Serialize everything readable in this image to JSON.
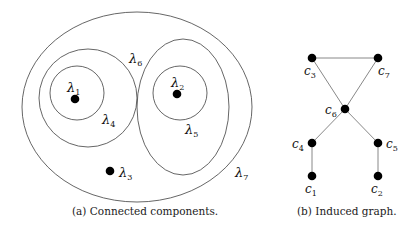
{
  "figure_a": {
    "caption": "(a) Connected components.",
    "regions": [
      {
        "id": "lambda7",
        "label": "λ",
        "sub": "7"
      },
      {
        "id": "lambda6",
        "label": "λ",
        "sub": "6"
      },
      {
        "id": "lambda4",
        "label": "λ",
        "sub": "4"
      },
      {
        "id": "lambda1",
        "label": "λ",
        "sub": "1"
      },
      {
        "id": "lambda5",
        "label": "λ",
        "sub": "5"
      },
      {
        "id": "lambda2",
        "label": "λ",
        "sub": "2"
      },
      {
        "id": "lambda3",
        "label": "λ",
        "sub": "3"
      }
    ]
  },
  "figure_b": {
    "caption": "(b) Induced graph.",
    "nodes": [
      {
        "id": "c1",
        "label": "c",
        "sub": "1"
      },
      {
        "id": "c2",
        "label": "c",
        "sub": "2"
      },
      {
        "id": "c3",
        "label": "c",
        "sub": "3"
      },
      {
        "id": "c4",
        "label": "c",
        "sub": "4"
      },
      {
        "id": "c5",
        "label": "c",
        "sub": "5"
      },
      {
        "id": "c6",
        "label": "c",
        "sub": "6"
      },
      {
        "id": "c7",
        "label": "c",
        "sub": "7"
      }
    ],
    "edges": [
      [
        "c3",
        "c7"
      ],
      [
        "c3",
        "c6"
      ],
      [
        "c7",
        "c6"
      ],
      [
        "c6",
        "c4"
      ],
      [
        "c6",
        "c5"
      ],
      [
        "c4",
        "c1"
      ],
      [
        "c5",
        "c2"
      ]
    ]
  }
}
